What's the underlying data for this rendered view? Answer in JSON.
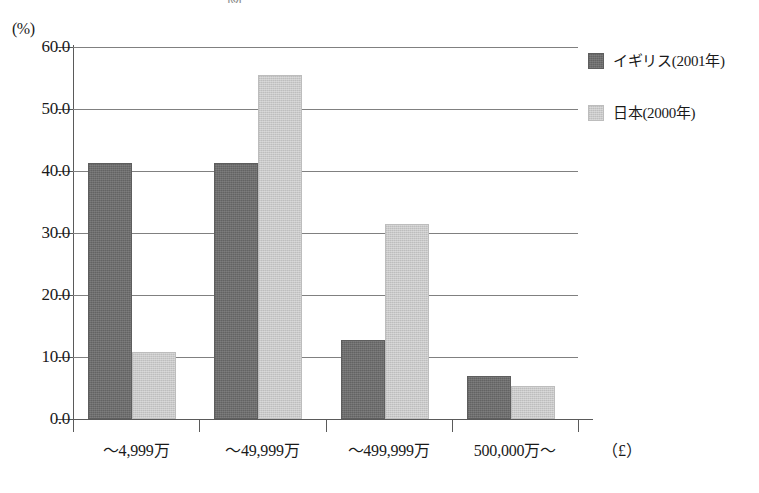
{
  "chart_data": {
    "type": "bar",
    "title": "図",
    "categories": [
      "～4,999万",
      "～49,999万",
      "～499,999万",
      "500,000万～"
    ],
    "series": [
      {
        "name": "イギリス(2001年)",
        "values": [
          41.3,
          41.3,
          12.7,
          6.9
        ],
        "color": "#6e6e6e"
      },
      {
        "name": "日本(2000年)",
        "values": [
          10.8,
          55.5,
          31.5,
          5.4
        ],
        "color": "#c9c9c9"
      }
    ],
    "xlabel": "（£）",
    "ylabel": "(%)",
    "ylim": [
      0,
      60
    ],
    "yticks": [
      "0.0",
      "10.0",
      "20.0",
      "30.0",
      "40.0",
      "50.0",
      "60.0"
    ],
    "ytick_values": [
      0,
      10,
      20,
      30,
      40,
      50,
      60
    ],
    "grid": true,
    "legend_position": "right-top"
  },
  "axes": {
    "y_unit": "(%)",
    "x_unit": "（£）"
  },
  "legend": {
    "entries": [
      {
        "label": "イギリス(2001年)",
        "color": "#6e6e6e"
      },
      {
        "label": "日本(2000年)",
        "color": "#c9c9c9"
      }
    ]
  }
}
